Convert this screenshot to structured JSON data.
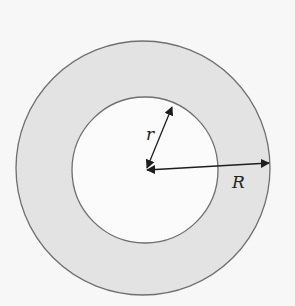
{
  "diagram": {
    "labels": {
      "inner_radius": "r",
      "outer_radius": "R"
    },
    "colors": {
      "background": "#f7f7f7",
      "ring_fill": "#e3e3e3",
      "inner_fill": "#fbfbfb",
      "stroke": "#6f6f6f",
      "arrow": "#1e1e1e"
    }
  }
}
